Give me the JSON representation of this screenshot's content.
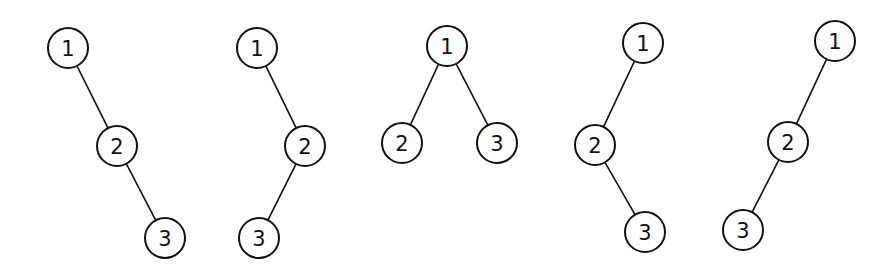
{
  "diagram": {
    "node_radius": 20,
    "colors": {
      "stroke": "#111111",
      "fill": "#ffffff",
      "background": "#ffffff"
    },
    "trees": [
      {
        "nodes": [
          {
            "label": "1",
            "x": 68,
            "y": 48
          },
          {
            "label": "2",
            "x": 117,
            "y": 146
          },
          {
            "label": "3",
            "x": 165,
            "y": 238
          }
        ],
        "edges": [
          [
            0,
            1
          ],
          [
            1,
            2
          ]
        ]
      },
      {
        "nodes": [
          {
            "label": "1",
            "x": 257,
            "y": 48
          },
          {
            "label": "2",
            "x": 305,
            "y": 146
          },
          {
            "label": "3",
            "x": 259,
            "y": 238
          }
        ],
        "edges": [
          [
            0,
            1
          ],
          [
            1,
            2
          ]
        ]
      },
      {
        "nodes": [
          {
            "label": "1",
            "x": 447,
            "y": 46
          },
          {
            "label": "2",
            "x": 402,
            "y": 143
          },
          {
            "label": "3",
            "x": 497,
            "y": 143
          }
        ],
        "edges": [
          [
            0,
            1
          ],
          [
            0,
            2
          ]
        ]
      },
      {
        "nodes": [
          {
            "label": "1",
            "x": 643,
            "y": 43
          },
          {
            "label": "2",
            "x": 595,
            "y": 145
          },
          {
            "label": "3",
            "x": 645,
            "y": 232
          }
        ],
        "edges": [
          [
            0,
            1
          ],
          [
            1,
            2
          ]
        ]
      },
      {
        "nodes": [
          {
            "label": "1",
            "x": 835,
            "y": 41
          },
          {
            "label": "2",
            "x": 788,
            "y": 142
          },
          {
            "label": "3",
            "x": 743,
            "y": 230
          }
        ],
        "edges": [
          [
            0,
            1
          ],
          [
            1,
            2
          ]
        ]
      }
    ]
  }
}
